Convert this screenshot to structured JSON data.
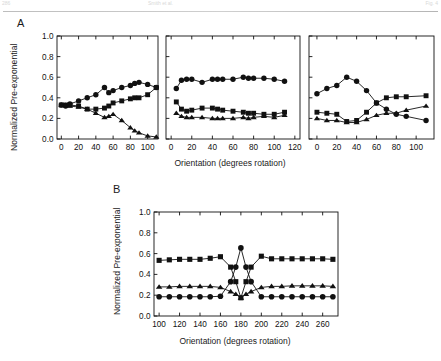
{
  "header": {
    "left": "286",
    "middle": "Smith et al.",
    "right": "Fig. 4"
  },
  "panels": {
    "a_letter": "A",
    "b_letter": "B"
  },
  "axis_titles": {
    "y": "Normalized Pre-exponential",
    "x": "Orientation (degrees rotation)"
  },
  "chart_data": [
    {
      "id": "panelA-chart1",
      "type": "line",
      "title": "",
      "xlabel": "Orientation (degrees rotation)",
      "ylabel": "Normalized Pre-exponential",
      "xlim": [
        -5,
        112
      ],
      "ylim": [
        0.0,
        1.0
      ],
      "xticks": [
        0,
        20,
        40,
        60,
        80,
        100
      ],
      "yticks": [
        "0.0",
        "0.2",
        "0.4",
        "0.6",
        "0.8",
        "1.0"
      ],
      "grid": false,
      "legend": "none",
      "x": [
        0,
        5,
        10,
        20,
        30,
        40,
        50,
        55,
        60,
        70,
        80,
        85,
        90,
        100,
        110
      ],
      "series": [
        {
          "name": "circle",
          "marker": "circle",
          "values": [
            0.33,
            0.32,
            0.34,
            0.37,
            0.4,
            0.43,
            0.5,
            0.45,
            0.47,
            0.5,
            0.52,
            0.54,
            0.55,
            0.53,
            0.5
          ]
        },
        {
          "name": "square",
          "marker": "square",
          "values": [
            0.33,
            0.33,
            0.33,
            0.32,
            0.29,
            0.29,
            0.3,
            0.32,
            0.35,
            0.37,
            0.39,
            0.4,
            0.4,
            0.43,
            0.5
          ]
        },
        {
          "name": "triangle",
          "marker": "triangle",
          "values": [
            0.33,
            0.33,
            0.32,
            0.31,
            0.29,
            0.25,
            0.21,
            0.22,
            0.24,
            0.18,
            0.11,
            0.08,
            0.06,
            0.03,
            0.02
          ]
        }
      ]
    },
    {
      "id": "panelA-chart2",
      "type": "line",
      "title": "",
      "xlabel": "Orientation (degrees rotation)",
      "ylabel": "Normalized Pre-exponential",
      "xlim": [
        -5,
        125
      ],
      "ylim": [
        0.0,
        1.0
      ],
      "xticks": [
        0,
        20,
        40,
        60,
        80,
        100,
        120
      ],
      "yticks": [
        "0.0",
        "0.2",
        "0.4",
        "0.6",
        "0.8",
        "1.0"
      ],
      "grid": false,
      "legend": "none",
      "x": [
        5,
        10,
        15,
        20,
        30,
        40,
        45,
        50,
        60,
        70,
        75,
        80,
        90,
        100,
        110
      ],
      "series": [
        {
          "name": "circle",
          "marker": "circle",
          "values": [
            0.49,
            0.57,
            0.58,
            0.58,
            0.55,
            0.58,
            0.58,
            0.58,
            0.58,
            0.6,
            0.59,
            0.59,
            0.59,
            0.58,
            0.56
          ]
        },
        {
          "name": "square",
          "marker": "square",
          "values": [
            0.36,
            0.29,
            0.27,
            0.28,
            0.3,
            0.3,
            0.29,
            0.28,
            0.27,
            0.26,
            0.25,
            0.25,
            0.24,
            0.24,
            0.26
          ]
        },
        {
          "name": "triangle",
          "marker": "triangle",
          "values": [
            0.25,
            0.22,
            0.21,
            0.21,
            0.21,
            0.2,
            0.2,
            0.2,
            0.2,
            0.21,
            0.2,
            0.21,
            0.22,
            0.21,
            0.23
          ]
        }
      ]
    },
    {
      "id": "panelA-chart3",
      "type": "line",
      "title": "",
      "xlabel": "Orientation (degrees rotation)",
      "ylabel": "Normalized Pre-exponential",
      "xlim": [
        -8,
        118
      ],
      "ylim": [
        0.0,
        1.0
      ],
      "xticks": [
        0,
        20,
        40,
        60,
        80,
        100
      ],
      "yticks": [
        "0.0",
        "0.2",
        "0.4",
        "0.6",
        "0.8",
        "1.0"
      ],
      "grid": false,
      "legend": "none",
      "x": [
        0,
        10,
        20,
        30,
        40,
        50,
        60,
        70,
        80,
        90,
        110
      ],
      "series": [
        {
          "name": "circle",
          "marker": "circle",
          "values": [
            0.44,
            0.49,
            0.52,
            0.6,
            0.56,
            0.47,
            0.35,
            0.29,
            0.24,
            0.22,
            0.18
          ]
        },
        {
          "name": "square",
          "marker": "square",
          "values": [
            0.26,
            0.25,
            0.24,
            0.17,
            0.18,
            0.26,
            0.35,
            0.4,
            0.41,
            0.41,
            0.42
          ]
        },
        {
          "name": "triangle",
          "marker": "triangle",
          "values": [
            0.2,
            0.18,
            0.18,
            0.16,
            0.16,
            0.19,
            0.23,
            0.25,
            0.25,
            0.28,
            0.32
          ]
        }
      ]
    },
    {
      "id": "panelB-chart",
      "type": "line",
      "title": "",
      "xlabel": "Orientation (degrees rotation)",
      "ylabel": "Normalized Pre-exponential",
      "xlim": [
        95,
        275
      ],
      "ylim": [
        0.0,
        1.0
      ],
      "xticks": [
        100,
        120,
        140,
        160,
        180,
        200,
        220,
        240,
        260
      ],
      "yticks": [
        "0.0",
        "0.2",
        "0.4",
        "0.6",
        "0.8",
        "1.0"
      ],
      "grid": false,
      "legend": "none",
      "x": [
        100,
        110,
        120,
        130,
        140,
        150,
        160,
        170,
        175,
        180,
        185,
        190,
        200,
        210,
        220,
        230,
        240,
        250,
        260,
        270
      ],
      "series": [
        {
          "name": "circle",
          "marker": "circle",
          "values": [
            0.185,
            0.185,
            0.185,
            0.185,
            0.185,
            0.185,
            0.19,
            0.33,
            0.47,
            0.655,
            0.47,
            0.33,
            0.185,
            0.185,
            0.185,
            0.185,
            0.185,
            0.185,
            0.185,
            0.185
          ]
        },
        {
          "name": "square",
          "marker": "square",
          "values": [
            0.535,
            0.54,
            0.545,
            0.545,
            0.545,
            0.555,
            0.57,
            0.47,
            0.33,
            0.175,
            0.33,
            0.47,
            0.575,
            0.55,
            0.55,
            0.55,
            0.55,
            0.55,
            0.55,
            0.545
          ]
        },
        {
          "name": "triangle",
          "marker": "triangle",
          "values": [
            0.28,
            0.28,
            0.285,
            0.285,
            0.285,
            0.285,
            0.275,
            0.235,
            0.21,
            0.175,
            0.21,
            0.235,
            0.275,
            0.285,
            0.285,
            0.29,
            0.29,
            0.29,
            0.29,
            0.285
          ]
        }
      ]
    }
  ]
}
